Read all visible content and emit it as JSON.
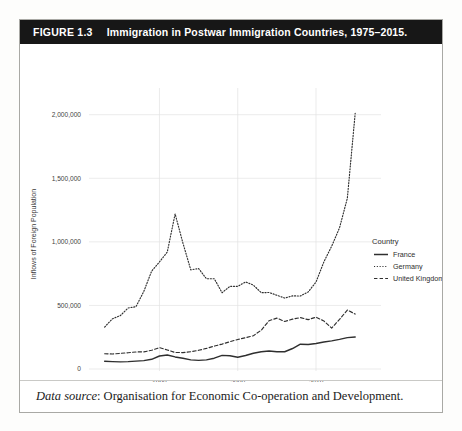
{
  "page": {
    "corner_note": ""
  },
  "figure": {
    "label": "FIGURE 1.3",
    "title": "Immigration in Postwar Immigration Countries, 1975–2015.",
    "caption_prefix": "Data source",
    "caption_rest": ": Organisation for Economic Co-operation and Development."
  },
  "chart_data": {
    "type": "line",
    "title": "Immigration in Postwar Immigration Countries, 1975–2015.",
    "xlabel": "",
    "ylabel": "Inflows of Foreign Population",
    "xlim": [
      1981,
      2016
    ],
    "ylim": [
      0,
      2100000
    ],
    "xticks": [
      1990,
      2000,
      2010
    ],
    "xticklabels": [
      "1990",
      "2000",
      "2010"
    ],
    "yticks": [
      0,
      500000,
      1000000,
      1500000,
      2000000
    ],
    "yticklabels": [
      "0",
      "500,000",
      "1,000,000",
      "1,500,000",
      "2,000,000"
    ],
    "grid": true,
    "legend_title": "Country",
    "legend_position": "right",
    "series": [
      {
        "name": "France",
        "style": "solid",
        "color": "#2f2f2f",
        "x": [
          1983,
          1984,
          1985,
          1986,
          1987,
          1988,
          1989,
          1990,
          1991,
          1992,
          1993,
          1994,
          1995,
          1996,
          1997,
          1998,
          1999,
          2000,
          2001,
          2002,
          2003,
          2004,
          2005,
          2006,
          2007,
          2008,
          2009,
          2010,
          2011,
          2012,
          2013,
          2014,
          2015
        ],
        "y": [
          61000,
          58000,
          56000,
          58000,
          62000,
          66000,
          76000,
          102000,
          110000,
          95000,
          84000,
          72000,
          68000,
          72000,
          85000,
          107000,
          104000,
          92000,
          106000,
          124000,
          136000,
          141000,
          135000,
          136000,
          161000,
          195000,
          193000,
          200000,
          212000,
          221000,
          233000,
          247000,
          252000
        ]
      },
      {
        "name": "Germany",
        "style": "dotted",
        "color": "#2f2f2f",
        "x": [
          1983,
          1984,
          1985,
          1986,
          1987,
          1988,
          1989,
          1990,
          1991,
          1992,
          1993,
          1994,
          1995,
          1996,
          1997,
          1998,
          1999,
          2000,
          2001,
          2002,
          2003,
          2004,
          2005,
          2006,
          2007,
          2008,
          2009,
          2010,
          2011,
          2012,
          2013,
          2014,
          2015
        ],
        "y": [
          330000,
          395000,
          420000,
          480000,
          490000,
          610000,
          770000,
          842000,
          920000,
          1220000,
          990000,
          780000,
          790000,
          710000,
          710000,
          600000,
          650000,
          650000,
          685000,
          660000,
          600000,
          602000,
          580000,
          558000,
          575000,
          574000,
          606000,
          684000,
          842000,
          966000,
          1110000,
          1343000,
          2010000
        ]
      },
      {
        "name": "United Kingdom",
        "style": "dashed",
        "color": "#2f2f2f",
        "x": [
          1983,
          1984,
          1985,
          1986,
          1987,
          1988,
          1989,
          1990,
          1991,
          1992,
          1993,
          1994,
          1995,
          1996,
          1997,
          1998,
          1999,
          2000,
          2001,
          2002,
          2003,
          2004,
          2005,
          2006,
          2007,
          2008,
          2009,
          2010,
          2011,
          2012,
          2013,
          2014,
          2015
        ],
        "y": [
          120000,
          118000,
          123000,
          128000,
          134000,
          135000,
          147000,
          168000,
          150000,
          130000,
          129000,
          136000,
          147000,
          162000,
          180000,
          196000,
          215000,
          232000,
          246000,
          262000,
          305000,
          380000,
          400000,
          374000,
          392000,
          404000,
          388000,
          408000,
          378000,
          322000,
          390000,
          464000,
          432000
        ]
      }
    ]
  }
}
